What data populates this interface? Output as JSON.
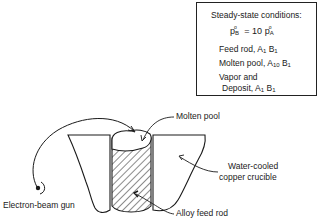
{
  "conditions_box": {
    "title": "Steady-state conditions:",
    "equation": {
      "lhs": "p",
      "lhs_sup": "o",
      "lhs_sub": "B",
      "operator": "= 10",
      "rhs": "p",
      "rhs_sup": "o",
      "rhs_sub": "A"
    },
    "rows": [
      {
        "label": "Feed rod, ",
        "a": "A",
        "a_sub": "1",
        "b": "B",
        "b_sub": "1"
      },
      {
        "label": "Molten pool, ",
        "a": "A",
        "a_sub": "10",
        "b": "B",
        "b_sub": "1"
      },
      {
        "label_line1": "Vapor and",
        "label": "Deposit, ",
        "a": "A",
        "a_sub": "1",
        "b": "B",
        "b_sub": "1"
      }
    ]
  },
  "labels": {
    "molten_pool": "Molten pool",
    "crucible_line1": "Water-cooled",
    "crucible_line2": "copper crucible",
    "electron_gun": "Electron-beam gun",
    "feed_rod": "Alloy feed rod"
  },
  "colors": {
    "ink": "#1a1a1a",
    "background": "#ffffff"
  }
}
